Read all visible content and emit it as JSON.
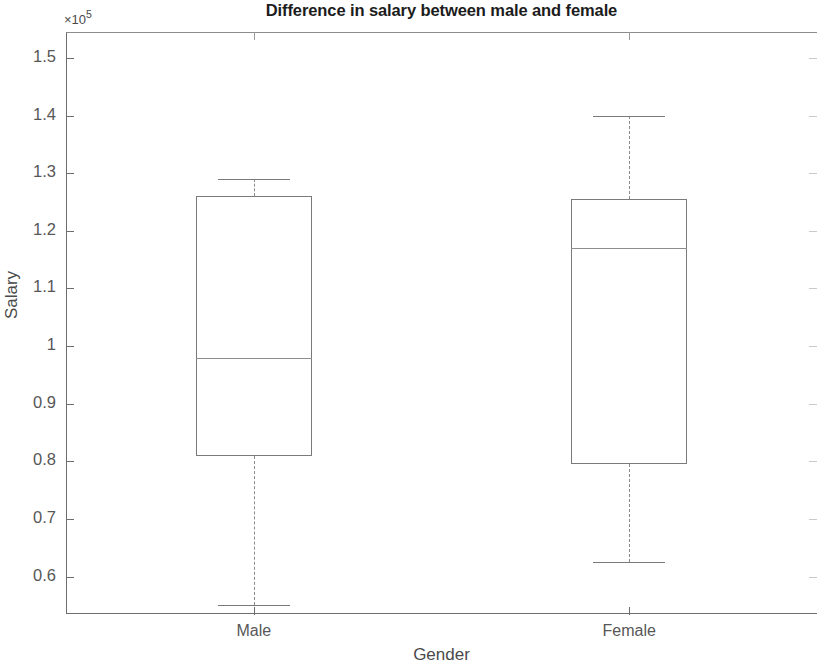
{
  "chart_data": {
    "type": "box",
    "title": "Difference in salary between male and female",
    "xlabel": "Gender",
    "ylabel": "Salary",
    "y_exponent_label": "×10⁵",
    "y_exponent_base": "×10",
    "y_exponent_power": "5",
    "y_scale_factor": 100000,
    "categories": [
      "Male",
      "Female"
    ],
    "ytick_labels": [
      "1.5",
      "1.4",
      "1.3",
      "1.2",
      "1.1",
      "1",
      "0.9",
      "0.8",
      "0.7",
      "0.6"
    ],
    "ytick_values": [
      1.5,
      1.4,
      1.3,
      1.2,
      1.1,
      1.0,
      0.9,
      0.8,
      0.7,
      0.6
    ],
    "ylim": [
      0.535,
      1.545
    ],
    "grid": false,
    "legend": false,
    "boxes": [
      {
        "label": "Male",
        "whisker_low": 0.55,
        "q1": 0.81,
        "median": 0.98,
        "q3": 1.26,
        "whisker_high": 1.29,
        "outliers": []
      },
      {
        "label": "Female",
        "whisker_low": 0.625,
        "q1": 0.795,
        "median": 1.17,
        "q3": 1.255,
        "whisker_high": 1.4,
        "outliers": []
      }
    ]
  },
  "colors": {
    "background": "#ffffff",
    "axis": "#6e6e6e",
    "box_outline": "#7a7a7a",
    "median": "#8e8e8e",
    "whisker": "#8a8a8a",
    "title_text": "#1c1c1c",
    "tick_text": "#575757",
    "label_text": "#4a4a4a"
  }
}
